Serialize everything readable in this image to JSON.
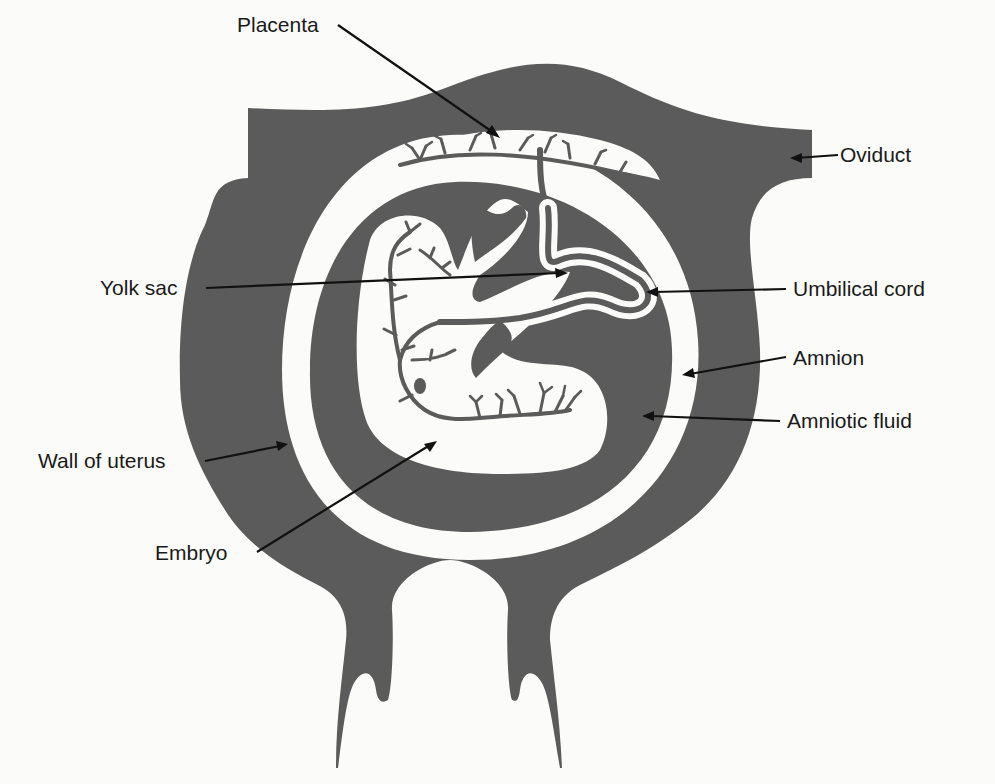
{
  "diagram": {
    "colors": {
      "tissue": "#5b5b5b",
      "background": "#fbfbf9",
      "label_text": "#1a1a1a",
      "leader_line": "#111111"
    },
    "labels": [
      {
        "id": "placenta",
        "text": "Placenta"
      },
      {
        "id": "oviduct",
        "text": "Oviduct"
      },
      {
        "id": "yolk_sac",
        "text": "Yolk sac"
      },
      {
        "id": "umbilical_cord",
        "text": "Umbilical cord"
      },
      {
        "id": "amnion",
        "text": "Amnion"
      },
      {
        "id": "amniotic_fluid",
        "text": "Amniotic fluid"
      },
      {
        "id": "wall_of_uterus",
        "text": "Wall of uterus"
      },
      {
        "id": "embryo",
        "text": "Embryo"
      }
    ]
  }
}
